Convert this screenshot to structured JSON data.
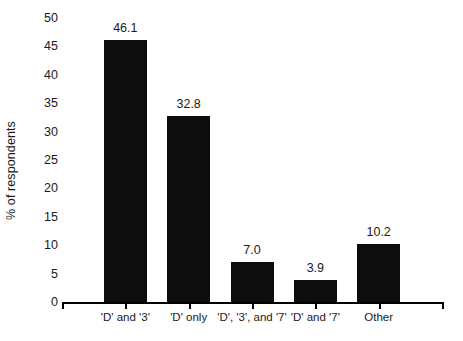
{
  "chart_data": {
    "type": "bar",
    "title": "",
    "subtitle": "",
    "xlabel": "",
    "ylabel": "% of respondents",
    "categories": [
      "'D' and '3'",
      "'D' only",
      "'D', '3', and '7'",
      "'D' and '7'",
      "Other"
    ],
    "values": [
      46.1,
      32.8,
      7.0,
      3.9,
      10.2
    ],
    "value_labels": [
      "46.1",
      "32.8",
      "7.0",
      "3.9",
      "10.2"
    ],
    "ylim": [
      0,
      50
    ],
    "ytick_values": [
      0,
      5,
      10,
      15,
      20,
      25,
      30,
      35,
      40,
      45,
      50
    ],
    "ytick_labels": [
      "0",
      "5",
      "10",
      "15",
      "20",
      "25",
      "30",
      "35",
      "40",
      "45",
      "50"
    ],
    "grid": false,
    "legend": false,
    "legend_position": "none",
    "bar_color": "#0d0d0d",
    "axis_color": "#000000",
    "text_color": "#1a1a1a",
    "background": "#ffffff"
  }
}
